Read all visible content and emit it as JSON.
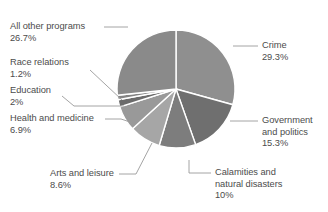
{
  "chart_data": {
    "type": "pie",
    "title": "",
    "subtitle": "",
    "xlabel": "",
    "ylabel": "",
    "legend_position": "callout-labels",
    "grid": false,
    "units": "percent",
    "center": {
      "x": 176,
      "y": 89
    },
    "radius": 59,
    "start_angle_deg": -90,
    "direction": "clockwise",
    "categories": [
      "Crime",
      "Government and politics",
      "Calamities and natural disasters",
      "Arts and leisure",
      "Health and medicine",
      "Education",
      "Race relations",
      "All other programs"
    ],
    "values": [
      29.3,
      15.3,
      10,
      8.6,
      6.9,
      2,
      1.2,
      26.7
    ],
    "slices": [
      {
        "name": "Crime",
        "label_lines": [
          "Crime",
          "29.3%"
        ],
        "value": 29.3,
        "value_text": "29.3%",
        "color": "#8f8f8f",
        "side": "right",
        "label_x": 262,
        "label_y": 40,
        "leader": {
          "x1": 233,
          "y1": 46,
          "x2": 258,
          "y2": 46
        }
      },
      {
        "name": "Government and politics",
        "label_lines": [
          "Government",
          "and politics",
          "15.3%"
        ],
        "value": 15.3,
        "value_text": "15.3%",
        "color": "#6f6f6f",
        "side": "right",
        "label_x": 262,
        "label_y": 115,
        "leader": {
          "x1": 230,
          "y1": 121,
          "x2": 258,
          "y2": 121
        }
      },
      {
        "name": "Calamities and natural disasters",
        "label_lines": [
          "Calamities and",
          "natural disasters",
          "10%"
        ],
        "value": 10,
        "value_text": "10%",
        "color": "#7d7d7d",
        "side": "right",
        "label_x": 215,
        "label_y": 167,
        "leader": {
          "x1": 189,
          "y1": 160,
          "x2": 189,
          "y2": 173,
          "x3": 211,
          "y3": 173
        }
      },
      {
        "name": "Arts and leisure",
        "label_lines": [
          "Arts and leisure",
          "8.6%"
        ],
        "value": 8.6,
        "value_text": "8.6%",
        "color": "#a6a6a6",
        "side": "left",
        "label_x": 50,
        "label_y": 168,
        "leader": {
          "x1": 152,
          "y1": 143,
          "x2": 136,
          "y2": 174,
          "x3": 119,
          "y3": 174
        }
      },
      {
        "name": "Health and medicine",
        "label_lines": [
          "Health and medicine",
          "6.9%"
        ],
        "value": 6.9,
        "value_text": "6.9%",
        "color": "#999999",
        "side": "left",
        "label_x": 10,
        "label_y": 113,
        "leader": {
          "x1": 133,
          "y1": 123,
          "x2": 121,
          "y2": 119,
          "x3": 105,
          "y3": 119
        }
      },
      {
        "name": "Education",
        "label_lines": [
          "Education",
          "2%"
        ],
        "value": 2,
        "value_text": "2%",
        "color": "#6b6b6b",
        "side": "left",
        "label_x": 10,
        "label_y": 85,
        "leader": {
          "x1": 124,
          "y1": 106,
          "x2": 74,
          "y2": 106,
          "x3": 62,
          "y3": 96
        }
      },
      {
        "name": "Race relations",
        "label_lines": [
          "Race relations",
          "1.2%"
        ],
        "value": 1.2,
        "value_text": "1.2%",
        "color": "#848484",
        "side": "left",
        "label_x": 10,
        "label_y": 57,
        "leader": {
          "x1": 122,
          "y1": 100,
          "x2": 90,
          "y2": 70
        }
      },
      {
        "name": "All other programs",
        "label_lines": [
          "All other programs",
          "26.7%"
        ],
        "value": 26.7,
        "value_text": "26.7%",
        "color": "#8a8a8a",
        "side": "left",
        "label_x": 10,
        "label_y": 21,
        "leader": {
          "x1": 128,
          "y1": 27,
          "x2": 104,
          "y2": 27
        }
      }
    ],
    "separator_color": "#ffffff",
    "separator_width": 1.4,
    "leader_color": "#9a9a9a",
    "text_color": "#4c4c4c",
    "background": "#ffffff"
  }
}
